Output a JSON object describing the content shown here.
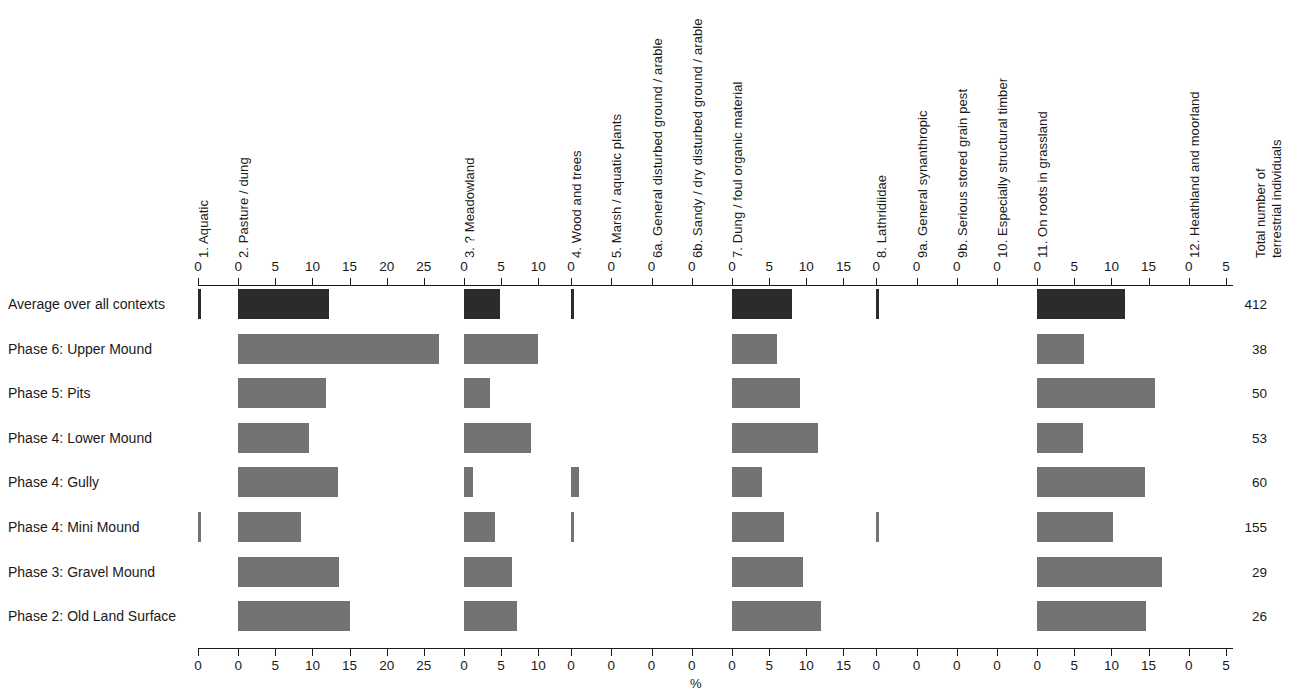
{
  "chart_data": {
    "type": "bar",
    "title": "",
    "xlabel": "%",
    "ylabel": "",
    "grid": false,
    "legend_position": "none",
    "orientation": "horizontal",
    "layout": "small-multiples-row-of-panels",
    "rows": [
      "Average over all contexts",
      "Phase 6: Upper Mound",
      "Phase 5: Pits",
      "Phase 4: Lower Mound",
      "Phase 4: Gully",
      "Phase 4: Mini Mound",
      "Phase 3: Gravel Mound",
      "Phase 2: Old Land Surface"
    ],
    "totals_header_line1": "Total number of",
    "totals_header_line2": "terrestrial individuals",
    "totals": [
      "412",
      "38",
      "50",
      "53",
      "60",
      "155",
      "29",
      "26"
    ],
    "panels": [
      {
        "label": "1. Aquatic",
        "ticks": [
          0
        ],
        "max": 3,
        "values": [
          0.35,
          0,
          0,
          0,
          0,
          0.35,
          0,
          0
        ]
      },
      {
        "label": "2. Pasture / dung",
        "ticks": [
          0,
          5,
          10,
          15,
          20,
          25
        ],
        "max": 28,
        "values": [
          12.2,
          27.0,
          11.8,
          9.5,
          13.4,
          8.4,
          13.6,
          15.0
        ]
      },
      {
        "label": "3. ? Meadowland",
        "ticks": [
          0,
          5,
          10
        ],
        "max": 12,
        "values": [
          4.9,
          10.0,
          3.5,
          9.0,
          1.2,
          4.2,
          6.5,
          7.2
        ]
      },
      {
        "label": "4. Wood and trees",
        "ticks": [
          0
        ],
        "max": 3,
        "values": [
          0.35,
          0,
          0,
          0,
          1.1,
          0.3,
          0,
          0
        ]
      },
      {
        "label": "5. Marsh / aquatic plants",
        "ticks": [
          0
        ],
        "max": 3,
        "values": [
          0,
          0,
          0,
          0,
          0,
          0,
          0,
          0
        ]
      },
      {
        "label": "6a. General disturbed ground / arable",
        "ticks": [
          0
        ],
        "max": 3,
        "values": [
          0,
          0,
          0,
          0,
          0,
          0,
          0,
          0
        ]
      },
      {
        "label": "6b. Sandy / dry disturbed ground / arable",
        "ticks": [
          0
        ],
        "max": 3,
        "values": [
          0,
          0,
          0,
          0,
          0,
          0,
          0,
          0
        ]
      },
      {
        "label": "7. Dung / foul organic material",
        "ticks": [
          0,
          5,
          10,
          15
        ],
        "max": 17,
        "values": [
          8.1,
          6.0,
          9.2,
          11.6,
          4.0,
          7.0,
          9.6,
          12.0
        ]
      },
      {
        "label": "8. Lathridiidae",
        "ticks": [
          0
        ],
        "max": 3,
        "values": [
          0.35,
          0,
          0,
          0,
          0,
          0.35,
          0,
          0
        ]
      },
      {
        "label": "9a. General synanthropic",
        "ticks": [
          0
        ],
        "max": 3,
        "values": [
          0,
          0,
          0,
          0,
          0,
          0,
          0,
          0
        ]
      },
      {
        "label": "9b. Serious stored grain pest",
        "ticks": [
          0
        ],
        "max": 3,
        "values": [
          0,
          0,
          0,
          0,
          0,
          0,
          0,
          0
        ]
      },
      {
        "label": "10. Especially structural timber",
        "ticks": [
          0
        ],
        "max": 3,
        "values": [
          0,
          0,
          0,
          0,
          0,
          0,
          0,
          0
        ]
      },
      {
        "label": "11. On roots in grassland",
        "ticks": [
          0,
          5,
          10,
          15
        ],
        "max": 18,
        "values": [
          11.8,
          6.3,
          15.8,
          6.2,
          14.5,
          10.2,
          16.8,
          14.6
        ]
      },
      {
        "label": "12. Heathland and moorland",
        "ticks": [
          0,
          5
        ],
        "max": 6,
        "values": [
          0,
          0,
          0,
          0,
          0,
          0,
          0,
          0
        ]
      }
    ]
  },
  "colors": {
    "bar": "#737373",
    "bar_average": "#2b2b2b",
    "axis": "#1a1a1a",
    "text": "#1a1a1a",
    "background": "#ffffff"
  }
}
